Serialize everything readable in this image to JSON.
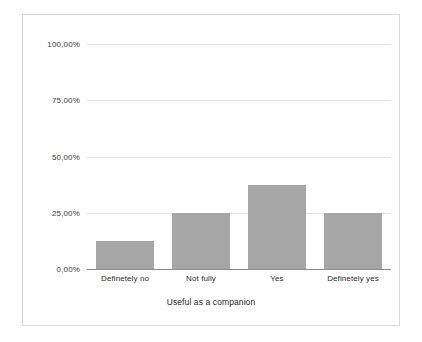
{
  "chart_data": {
    "type": "bar",
    "title": "",
    "xlabel": "Useful as a companion",
    "ylabel": "",
    "categories": [
      "Definetely no",
      "Not fully",
      "Yes",
      "Definetely yes"
    ],
    "values": [
      12.5,
      25.0,
      37.5,
      25.0
    ],
    "value_labels": [
      "12,50%",
      "25,00%",
      "37,50%",
      "25,00%"
    ],
    "ylim": [
      0,
      100
    ],
    "ytick_values": [
      0,
      25,
      50,
      75,
      100
    ],
    "ytick_labels": [
      "0,00%",
      "25,00%",
      "50,00%",
      "75,00%",
      "100,00%"
    ],
    "grid": true,
    "legend": "none",
    "series": [
      {
        "name": "Useful as a companion",
        "values": [
          12.5,
          25.0,
          37.5,
          25.0
        ]
      }
    ],
    "colors": {
      "bar_fill": "#a6a6a6",
      "gridline": "#e2e2e2",
      "axis_line": "#8c8c8c",
      "frame_border": "#d9d9d9",
      "background": "#ffffff",
      "tick_text": "#3d3d3d",
      "label_text": "#2b2b2b"
    }
  }
}
